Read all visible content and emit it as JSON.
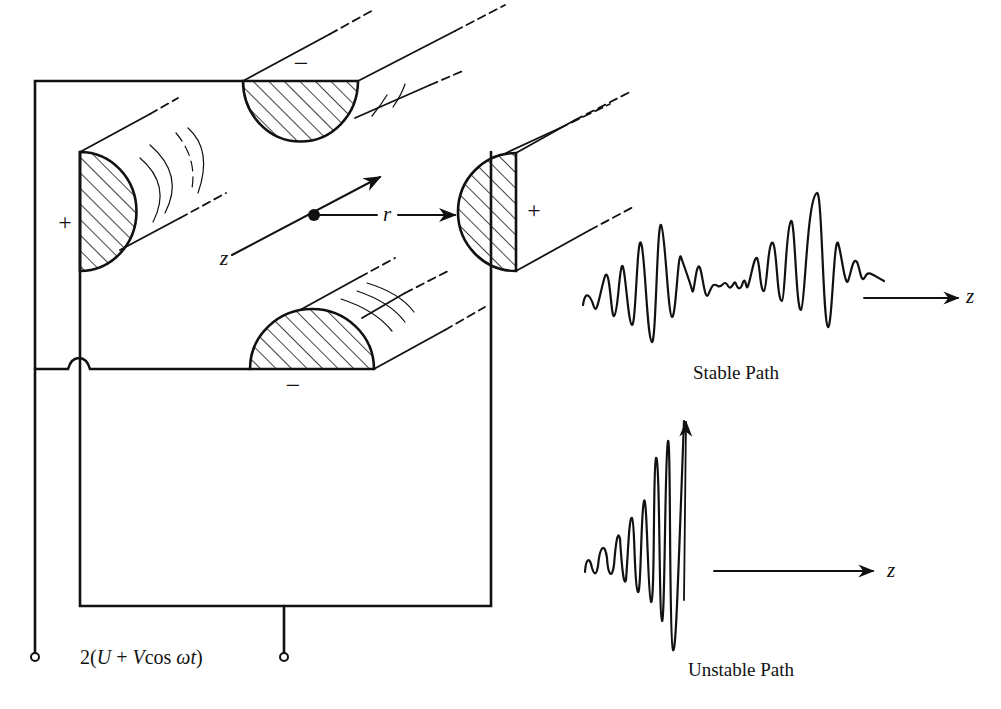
{
  "electrodes": {
    "top": {
      "polarity": "−"
    },
    "bottom": {
      "polarity": "−"
    },
    "left": {
      "polarity": "+"
    },
    "right": {
      "polarity": "+"
    }
  },
  "axes": {
    "z_label": "z",
    "r_label": "r"
  },
  "supply": {
    "voltage_label": "2(U + Vcos ωt)",
    "voltage_parts": {
      "prefix": "2(",
      "U": "U",
      "plus": " + ",
      "V": "V",
      "cos": "cos ",
      "omega_t": "ωt",
      "suffix": ")"
    }
  },
  "stable": {
    "caption": "Stable Path",
    "axis_label": "z"
  },
  "unstable": {
    "caption": "Unstable Path",
    "axis_label": "z"
  },
  "colors": {
    "ink": "#111111",
    "background": "#ffffff"
  }
}
